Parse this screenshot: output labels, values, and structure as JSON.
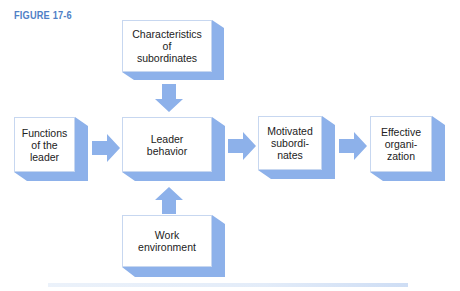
{
  "figure": {
    "label": "FIGURE 17-6"
  },
  "boxes": {
    "characteristics": {
      "lines": [
        "Characteristics",
        "of",
        "subordinates"
      ]
    },
    "functions": {
      "lines": [
        "Functions",
        "of the",
        "leader"
      ]
    },
    "leader_behavior": {
      "lines": [
        "Leader",
        "behavior"
      ]
    },
    "motivated": {
      "lines": [
        "Motivated",
        "subordi-",
        "nates"
      ]
    },
    "effective": {
      "lines": [
        "Effective",
        "organi-",
        "zation"
      ]
    },
    "work_env": {
      "lines": [
        "Work",
        "environment"
      ]
    }
  },
  "edges": [
    {
      "from": "Characteristics of subordinates",
      "to": "Leader behavior"
    },
    {
      "from": "Functions of the leader",
      "to": "Leader behavior"
    },
    {
      "from": "Work environment",
      "to": "Leader behavior"
    },
    {
      "from": "Leader behavior",
      "to": "Motivated subordinates"
    },
    {
      "from": "Motivated subordinates",
      "to": "Effective organization"
    }
  ],
  "colors": {
    "accent": "#8db1ea",
    "label": "#4f7fc6"
  }
}
